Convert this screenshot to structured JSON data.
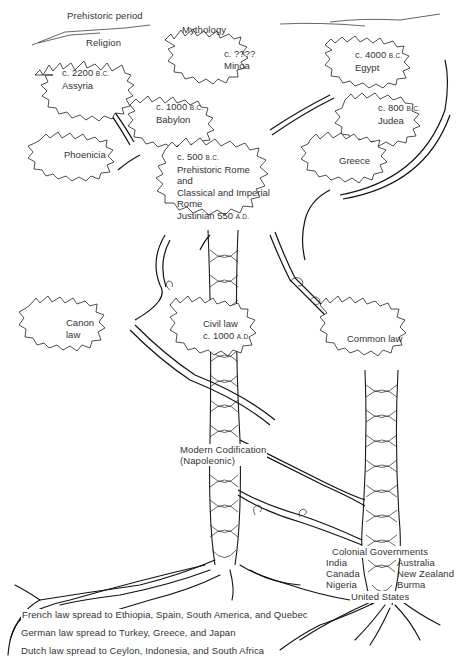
{
  "diagram": {
    "title_labels": {
      "prehistoric": "Prehistoric period",
      "religion": "Religion",
      "mythology": "Mythology"
    },
    "ancient_nodes": [
      {
        "id": "assyria",
        "date": "c. 2200",
        "era": "B.C.",
        "name": "Assyria"
      },
      {
        "id": "minoa",
        "date": "c. ????",
        "era": "",
        "name": "Minoa"
      },
      {
        "id": "egypt",
        "date": "c. 4000",
        "era": "B.C.",
        "name": "Egypt"
      },
      {
        "id": "babylon",
        "date": "c. 1000",
        "era": "B.C.",
        "name": "Babylon"
      },
      {
        "id": "judea",
        "date": "c. 800",
        "era": "B.C.",
        "name": "Judea"
      },
      {
        "id": "phoenicia",
        "name": "Phoenicia"
      },
      {
        "id": "greece",
        "name": "Greece"
      }
    ],
    "rome": {
      "date": "c. 500",
      "era": "B.C.",
      "line1": "Prehistoric Rome",
      "line2": "and",
      "line3": "Classical and Imperial",
      "line4": "Rome",
      "line5": "Justinian 550",
      "line5_era": "A.D."
    },
    "law_nodes": {
      "canon": {
        "line1": "Canon",
        "line2": "law"
      },
      "civil": {
        "line1": "Civil law",
        "line2": "c. 1000",
        "era": "A.D."
      },
      "common": {
        "line1": "Common law"
      }
    },
    "modern_codification": {
      "line1": "Modern Codification",
      "line2": "(Napoleonic)"
    },
    "colonial": {
      "title": "Colonial Governments",
      "left": [
        "India",
        "Canada",
        "Nigeria"
      ],
      "right": [
        "Australia",
        "New Zealand",
        "Burma"
      ],
      "bottom": "United States"
    },
    "root_notes": [
      "French law spread to Ethiopia, Spain, South America, and Quebec",
      "German law spread to Turkey, Greece, and Japan",
      "Dutch law spread to Ceylon, Indonesia, and South Africa"
    ]
  }
}
